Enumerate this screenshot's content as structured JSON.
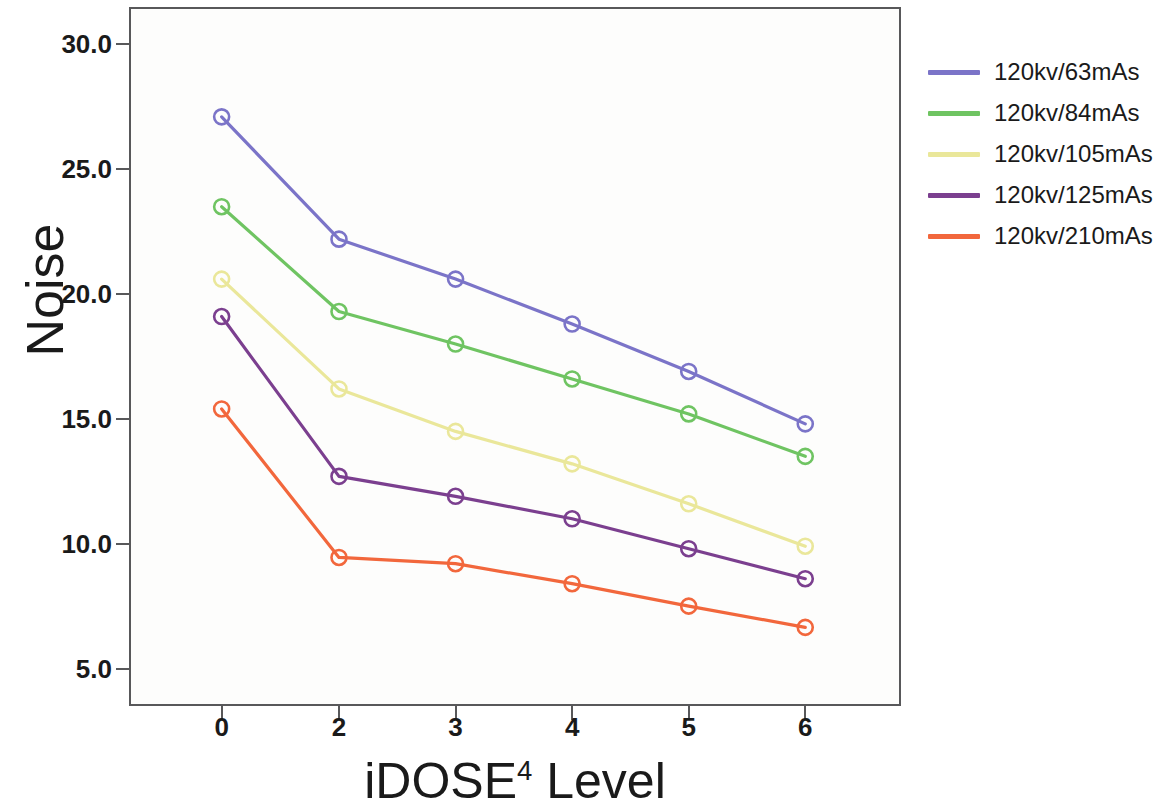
{
  "chart_data": {
    "type": "line",
    "title": "",
    "xlabel": "iDOSE⁴ Level",
    "xlabel_base": "iDOSE",
    "xlabel_sup": "4",
    "xlabel_tail": " Level",
    "ylabel": "Noise",
    "categories": [
      "0",
      "2",
      "3",
      "4",
      "5",
      "6"
    ],
    "ylim": [
      3.5,
      31.5
    ],
    "yticks": [
      "5.0",
      "10.0",
      "15.0",
      "20.0",
      "25.0",
      "30.0"
    ],
    "ytick_values": [
      5.0,
      10.0,
      15.0,
      20.0,
      25.0,
      30.0
    ],
    "grid": false,
    "legend_position": "right",
    "marker": "open-circle",
    "series": [
      {
        "name": "120kv/63mAs",
        "color": "#7b74c8",
        "values": [
          27.1,
          22.2,
          20.6,
          18.8,
          16.9,
          14.8
        ]
      },
      {
        "name": "120kv/84mAs",
        "color": "#6fc462",
        "values": [
          23.5,
          19.3,
          18.0,
          16.6,
          15.2,
          13.5
        ]
      },
      {
        "name": "120kv/105mAs",
        "color": "#eae79a",
        "values": [
          20.6,
          16.2,
          14.5,
          13.2,
          11.6,
          9.9
        ]
      },
      {
        "name": "120kv/125mAs",
        "color": "#7b3f8f",
        "values": [
          19.1,
          12.7,
          11.9,
          11.0,
          9.8,
          8.6
        ]
      },
      {
        "name": "120kv/210mAs",
        "color": "#f2673c",
        "values": [
          15.4,
          9.45,
          9.2,
          8.4,
          7.5,
          6.65
        ]
      }
    ]
  },
  "legend": {
    "items": [
      {
        "label": "120kv/63mAs",
        "color": "#7b74c8"
      },
      {
        "label": "120kv/84mAs",
        "color": "#6fc462"
      },
      {
        "label": "120kv/105mAs",
        "color": "#eae79a"
      },
      {
        "label": "120kv/125mAs",
        "color": "#7b3f8f"
      },
      {
        "label": "120kv/210mAs",
        "color": "#f2673c"
      }
    ]
  },
  "axes": {
    "y_title": "Noise",
    "x_title_base": "iDOSE",
    "x_title_sup": "4",
    "x_title_tail": " Level"
  },
  "colors": {
    "frame": "#58585a",
    "text": "#1a1a1a",
    "plot_background": "#fdfdfc"
  }
}
